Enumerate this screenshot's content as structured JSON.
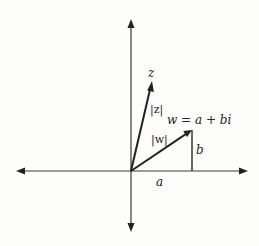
{
  "diagram": {
    "colors": {
      "background": "#fdfdfc",
      "ink": "#222222",
      "axis": "#3a3a3a"
    },
    "origin": [
      131,
      171
    ],
    "axes": {
      "horizontal": {
        "left_tip": [
          16,
          171
        ],
        "right_tip": [
          248,
          171
        ]
      },
      "vertical": {
        "top_tip": [
          131,
          19
        ],
        "bottom_tip": [
          131,
          232
        ]
      }
    },
    "vectors": [
      {
        "name": "z",
        "from": [
          131,
          171
        ],
        "to": [
          152,
          81
        ]
      },
      {
        "name": "w",
        "from": [
          131,
          171
        ],
        "to": [
          192,
          130
        ]
      }
    ],
    "segments": [
      {
        "name": "b-leg",
        "from": [
          192,
          130
        ],
        "to": [
          192,
          171
        ]
      }
    ],
    "labels": {
      "z": "z",
      "z_modulus": "|z|",
      "w_modulus": "|w|",
      "w_equation": "w = a + bi",
      "real_part": "a",
      "imag_part": "b"
    }
  }
}
